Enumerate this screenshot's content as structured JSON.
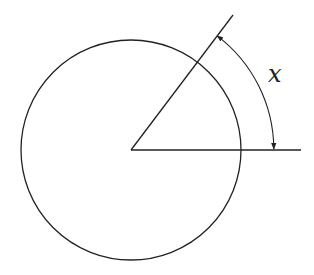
{
  "diagram": {
    "title": "",
    "circle": {
      "cx": 131,
      "cy": 150,
      "r": 110
    },
    "center": {
      "x": 131,
      "y": 150
    },
    "rays": [
      {
        "name": "initial-side",
        "x2": 301,
        "y2": 150
      },
      {
        "name": "terminal-side",
        "x2": 233,
        "y2": 15
      }
    ],
    "angle_arc": {
      "radius": 143,
      "has_arrows": true
    },
    "angle_label": "x",
    "stroke_color": "#222222",
    "background_color": "#ffffff"
  }
}
